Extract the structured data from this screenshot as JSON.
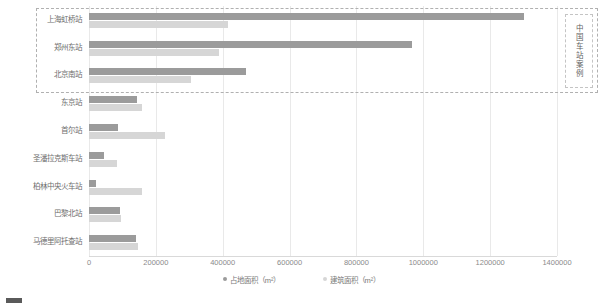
{
  "chart_data": {
    "type": "bar",
    "orientation": "horizontal",
    "title": "",
    "subtitle": "",
    "xlabel": "",
    "ylabel": "",
    "xlim": [
      0,
      1400000
    ],
    "xticks": [
      0,
      200000,
      400000,
      600000,
      800000,
      1000000,
      1200000,
      1400000
    ],
    "xtick_labels": [
      "0",
      "200000",
      "400000",
      "600000",
      "800000",
      "1000000",
      "1200000",
      "1400000"
    ],
    "grid": true,
    "legend_position": "bottom",
    "categories": [
      "上海虹桥站",
      "郑州东站",
      "北京南站",
      "东京站",
      "首尔站",
      "圣潘拉克斯车站",
      "柏林中央火车站",
      "巴黎北站",
      "马德里阿托查站"
    ],
    "series": [
      {
        "name": "占地面积（m²）",
        "color": "#9b9b9b",
        "values": [
          1300000,
          965000,
          470000,
          145000,
          86000,
          45000,
          20000,
          92000,
          140000
        ]
      },
      {
        "name": "建筑面积（m²）",
        "color": "#d6d6d6",
        "values": [
          415000,
          390000,
          305000,
          160000,
          228000,
          85000,
          158000,
          97000,
          148000
        ]
      }
    ],
    "annotations": [
      {
        "name": "china-station-cases",
        "label": "中国车站案例",
        "covers": [
          "上海虹桥站",
          "郑州东站",
          "北京南站"
        ],
        "style": "dashed-rectangle"
      }
    ]
  },
  "legend": {
    "items": [
      {
        "label": "占地面积（m²）",
        "color": "#9b9b9b"
      },
      {
        "label": "建筑面积（m²）",
        "color": "#d6d6d6"
      }
    ]
  },
  "annotation_box": {
    "vertical_label": "中国车站案例"
  },
  "caption": {
    "text": ""
  }
}
